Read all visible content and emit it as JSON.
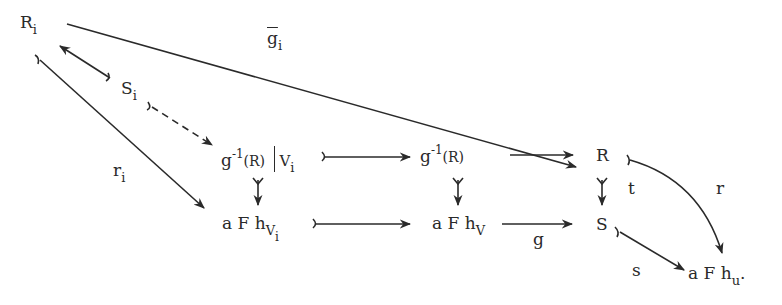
{
  "diagram": {
    "type": "commutative-diagram",
    "ink_color": "#2a2a2a",
    "background": "#ffffff",
    "nodes": {
      "Ri": {
        "base": "R",
        "sub": "i"
      },
      "Si": {
        "base": "S",
        "sub": "i"
      },
      "g_inv_R_restricted": {
        "base": "g",
        "sup": "-1",
        "rest": "(R)",
        "restrict_to": "V",
        "restrict_sub": "i"
      },
      "g_inv_R": {
        "base": "g",
        "sup": "-1",
        "rest": "(R)"
      },
      "R": {
        "base": "R"
      },
      "aFh_Vi": {
        "base": "a F h",
        "sub": "V",
        "subsub": "i"
      },
      "aFh_V": {
        "base": "a F h",
        "sub": "V"
      },
      "S": {
        "base": "S"
      },
      "aFh_u": {
        "base": "a F h",
        "sub": "u",
        "trail": "."
      }
    },
    "labels": {
      "g_bar_i": {
        "base": "g",
        "sub": "i"
      },
      "r_i": {
        "base": "r",
        "sub": "i"
      },
      "g": "g",
      "t": "t",
      "r": "r",
      "s": "s"
    },
    "edges": [
      {
        "from": "Ri",
        "to": "R",
        "label": "g_bar_i",
        "style": "solid"
      },
      {
        "from": "Si",
        "to": "Ri",
        "style": "solid",
        "tail": "mono"
      },
      {
        "from": "Si",
        "to": "g_inv_R_restricted",
        "style": "dashed",
        "tail": "mono"
      },
      {
        "from": "Ri",
        "to": "aFh_Vi",
        "label": "r_i",
        "style": "solid",
        "tail": "mono"
      },
      {
        "from": "g_inv_R_restricted",
        "to": "g_inv_R",
        "style": "solid",
        "tail": "mono"
      },
      {
        "from": "g_inv_R",
        "to": "R",
        "style": "solid"
      },
      {
        "from": "g_inv_R_restricted",
        "to": "aFh_Vi",
        "style": "solid",
        "tail": "mono"
      },
      {
        "from": "g_inv_R",
        "to": "aFh_V",
        "style": "solid",
        "tail": "mono"
      },
      {
        "from": "R",
        "to": "S",
        "label": "t",
        "style": "solid",
        "tail": "mono"
      },
      {
        "from": "aFh_Vi",
        "to": "aFh_V",
        "style": "solid",
        "tail": "mono"
      },
      {
        "from": "aFh_V",
        "to": "S",
        "label": "g",
        "style": "solid"
      },
      {
        "from": "R",
        "to": "aFh_u",
        "label": "r",
        "style": "curved",
        "tail": "mono"
      },
      {
        "from": "S",
        "to": "aFh_u",
        "label": "s",
        "style": "solid",
        "tail": "mono"
      }
    ]
  }
}
